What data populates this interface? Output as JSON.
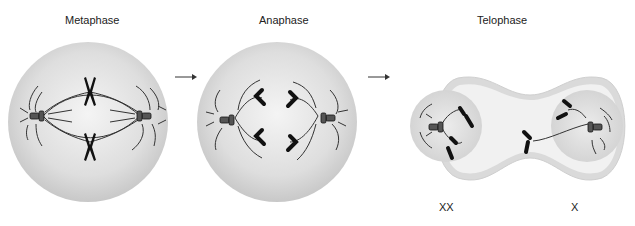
{
  "figure": {
    "stages": [
      {
        "id": "metaphase",
        "label": "Metaphase"
      },
      {
        "id": "anaphase",
        "label": "Anaphase"
      },
      {
        "id": "telophase",
        "label": "Telophase"
      }
    ],
    "daughter_cells": [
      {
        "label": "XX"
      },
      {
        "label": "X"
      }
    ],
    "arrows": [
      "metaphase-to-anaphase",
      "anaphase-to-telophase"
    ],
    "colors": {
      "cell_fill": "#d8d8d8",
      "cell_center": "#f2f2f2",
      "chromosome": "#111111",
      "spindle": "#333333",
      "background": "#ffffff"
    }
  }
}
